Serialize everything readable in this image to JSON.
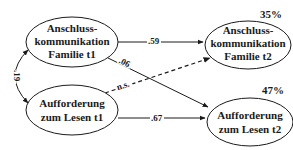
{
  "diagram": {
    "type": "path-model",
    "nodes": [
      {
        "id": "akf_t1",
        "lines": [
          "Anschluss-",
          "kommunikation",
          "Familie t1"
        ]
      },
      {
        "id": "akf_t2",
        "lines": [
          "Anschluss-",
          "kommunikation",
          "Familie t2"
        ],
        "explained_variance": "35%"
      },
      {
        "id": "azl_t1",
        "lines": [
          "Aufforderung",
          "zum Lesen t1"
        ]
      },
      {
        "id": "azl_t2",
        "lines": [
          "Aufforderung",
          "zum Lesen t2"
        ],
        "explained_variance": "47%"
      }
    ],
    "edges": [
      {
        "from": "akf_t1",
        "to": "akf_t2",
        "label": ".59",
        "style": "solid"
      },
      {
        "from": "akf_t1",
        "to": "azl_t2",
        "label": ".06",
        "style": "solid"
      },
      {
        "from": "azl_t1",
        "to": "akf_t2",
        "label": "n.s.",
        "style": "dashed"
      },
      {
        "from": "azl_t1",
        "to": "azl_t2",
        "label": ".67",
        "style": "solid"
      },
      {
        "from": "akf_t1",
        "to": "azl_t1",
        "label": ".19",
        "style": "curved-bidirectional"
      }
    ]
  }
}
